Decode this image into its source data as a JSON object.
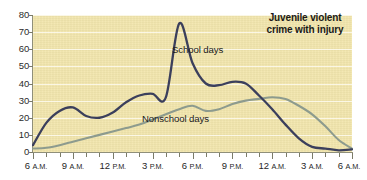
{
  "chart_data": {
    "type": "line",
    "title": "Juvenile violent crime with injury",
    "xlabel": "",
    "ylabel": "",
    "ylim": [
      0,
      80
    ],
    "yticks": [
      0,
      10,
      20,
      30,
      40,
      50,
      60,
      70,
      80
    ],
    "grid": true,
    "legend_position": "inline-annotations",
    "x": [
      "6 A.M.",
      "7 A.M.",
      "8 A.M.",
      "9 A.M.",
      "10 A.M.",
      "11 A.M.",
      "12 P.M.",
      "1 P.M.",
      "2 P.M.",
      "3 P.M.",
      "4 P.M.",
      "5 P.M.",
      "6 P.M.",
      "7 P.M.",
      "8 P.M.",
      "9 P.M.",
      "10 P.M.",
      "11 P.M.",
      "12 A.M.",
      "1 A.M.",
      "2 A.M.",
      "3 A.M.",
      "4 A.M.",
      "5 A.M.",
      "6 A.M."
    ],
    "xtick_labels": [
      "6 A.M.",
      "9 A.M.",
      "12 P.M.",
      "3 P.M.",
      "6 P.M.",
      "9 P.M.",
      "12 A.M.",
      "3 A.M.",
      "6 A.M."
    ],
    "xtick_hours": [
      0,
      3,
      6,
      9,
      12,
      15,
      18,
      21,
      24
    ],
    "series": [
      {
        "name": "School days",
        "color": "#3b3f5c",
        "values": [
          4,
          17,
          24,
          26,
          21,
          20,
          23,
          29,
          33,
          34,
          32,
          75,
          52,
          40,
          39,
          41,
          40,
          33,
          25,
          16,
          8,
          3,
          2,
          1,
          1.5
        ]
      },
      {
        "name": "Nonschool days",
        "color": "#8d9b8e",
        "values": [
          2,
          2.5,
          4,
          6,
          8,
          10,
          12,
          14,
          16,
          19,
          22,
          25,
          27,
          24,
          25,
          28,
          30,
          31,
          32,
          31,
          27,
          22,
          15,
          7,
          2
        ]
      }
    ],
    "annotations": [
      {
        "text": "School days",
        "x": "2:00 P.M. region"
      },
      {
        "text": "Nonschool days",
        "x": "1:00 P.M. region"
      }
    ]
  },
  "labels": {
    "school_days": "School days",
    "nonschool_days": "Nonschool days",
    "title_line1": "Juvenile violent",
    "title_line2": "crime with injury"
  },
  "colors": {
    "plot_background": "#f2e6ad",
    "page_background": "#ffffff",
    "school_days_line": "#3b3f5c",
    "nonschool_days_line": "#8d9b8e",
    "axis": "#8f8f7a",
    "gridline": "#fdfaef",
    "text": "#1a1a1a"
  }
}
